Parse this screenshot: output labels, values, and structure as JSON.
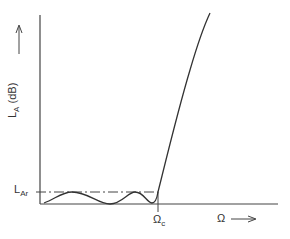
{
  "diagram": {
    "y_axis": {
      "label_main": "L",
      "label_sub": "A",
      "label_unit": " (dB)",
      "arrow": "up-arrow"
    },
    "x_axis": {
      "label": "Ω",
      "arrow": "right-arrow"
    },
    "ripple_level": {
      "main": "L",
      "sub": "Ar"
    },
    "cutoff": {
      "main": "Ω",
      "sub": "c"
    },
    "colors": {
      "stroke": "#333333",
      "background": "#ffffff"
    }
  }
}
